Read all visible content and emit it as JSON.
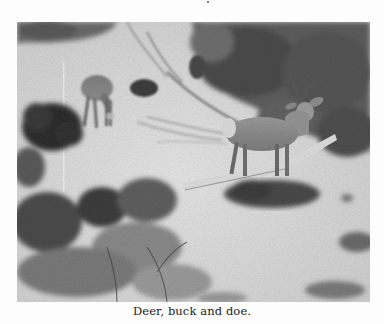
{
  "page": {
    "background": "#fdfdfd"
  },
  "figure": {
    "photo": {
      "description": "Black-and-white photograph of two mule deer in brushy terrain: a doe grazing at upper left and an antlered buck standing at right center.",
      "subjects": [
        "doe",
        "buck"
      ],
      "tone": "grayscale"
    },
    "caption": "Deer, buck and doe."
  }
}
